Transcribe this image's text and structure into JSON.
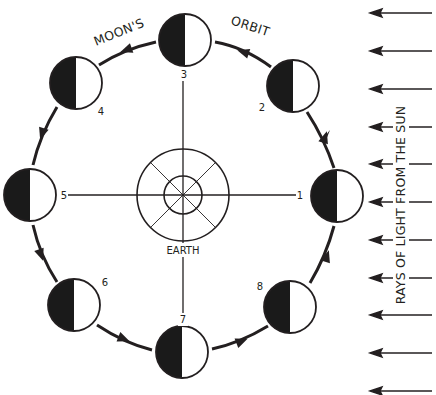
{
  "diagram": {
    "type": "moon-phases-orbit",
    "colors": {
      "ink": "#231f20",
      "background": "#ffffff",
      "moon_dark": "#1a1a1a",
      "moon_light": "#ffffff"
    },
    "orbit_title_left": "MOON'S",
    "orbit_title_right": "ORBIT",
    "earth_label": "EARTH",
    "sun_label": "RAYS OF LIGHT FROM THE SUN",
    "sun_direction": "right-to-left",
    "sun_ray_count": 11,
    "moons": [
      {
        "id": 1,
        "label": "1",
        "position": "right"
      },
      {
        "id": 2,
        "label": "2",
        "position": "upper-right"
      },
      {
        "id": 3,
        "label": "3",
        "position": "top"
      },
      {
        "id": 4,
        "label": "4",
        "position": "upper-left"
      },
      {
        "id": 5,
        "label": "5",
        "position": "left"
      },
      {
        "id": 6,
        "label": "6",
        "position": "lower-left"
      },
      {
        "id": 7,
        "label": "7",
        "position": "bottom"
      },
      {
        "id": 8,
        "label": "8",
        "position": "lower-right"
      }
    ],
    "moon_shading": "left half dark, right half lit (facing sun)",
    "orbit_direction": "counter-clockwise"
  }
}
